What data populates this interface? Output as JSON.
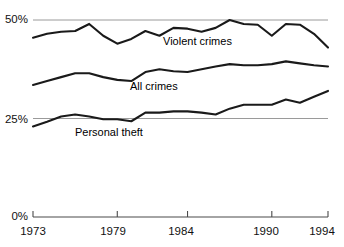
{
  "chart_data": {
    "type": "line",
    "title": "",
    "subtitle": "",
    "xlabel": "",
    "ylabel": "",
    "xlim": [
      1973,
      1994
    ],
    "ylim": [
      0,
      50
    ],
    "grid": true,
    "gridlines_y": [
      25,
      50
    ],
    "legend_position": "inline-annotations",
    "x": [
      1973,
      1974,
      1975,
      1976,
      1977,
      1978,
      1979,
      1980,
      1981,
      1982,
      1983,
      1984,
      1985,
      1986,
      1987,
      1988,
      1989,
      1990,
      1991,
      1992,
      1993,
      1994
    ],
    "y_ticks": [
      0,
      25,
      50
    ],
    "y_tick_labels": [
      "0%",
      "25%",
      "50%"
    ],
    "x_ticks": [
      1973,
      1979,
      1984,
      1990,
      1994
    ],
    "x_tick_labels": [
      "1973",
      "1979",
      "1984",
      "1990",
      "1994"
    ],
    "series": [
      {
        "name": "Violent crimes",
        "label": "Violent crimes",
        "color": "#1a1a1a",
        "values": [
          45.5,
          46.5,
          47.0,
          47.2,
          49.0,
          46.0,
          44.0,
          45.2,
          47.2,
          46.0,
          48.0,
          47.8,
          47.0,
          48.0,
          50.0,
          49.0,
          48.8,
          46.0,
          49.0,
          48.8,
          46.5,
          43.0
        ]
      },
      {
        "name": "All crimes",
        "label": "All crimes",
        "color": "#1a1a1a",
        "values": [
          33.5,
          34.5,
          35.5,
          36.5,
          36.5,
          35.5,
          34.8,
          34.5,
          36.8,
          37.5,
          37.0,
          36.8,
          37.5,
          38.2,
          38.8,
          38.5,
          38.5,
          38.8,
          39.5,
          39.0,
          38.5,
          38.2
        ]
      },
      {
        "name": "Personal theft",
        "label": "Personal theft",
        "color": "#1a1a1a",
        "values": [
          23.0,
          24.2,
          25.5,
          26.0,
          25.5,
          24.8,
          24.8,
          24.3,
          26.5,
          26.5,
          26.8,
          26.8,
          26.5,
          26.0,
          27.5,
          28.5,
          28.5,
          28.5,
          29.8,
          29.0,
          30.5,
          32.0
        ]
      }
    ],
    "annotations": [
      {
        "text": "Violent crimes",
        "x_px": 163,
        "y_px": 36
      },
      {
        "text": "All crimes",
        "x_px": 130,
        "y_px": 81
      },
      {
        "text": "Personal theft",
        "x_px": 75,
        "y_px": 127
      }
    ]
  },
  "axis": {
    "y_labels": [
      {
        "text": "50%"
      },
      {
        "text": "25%"
      },
      {
        "text": "0%"
      }
    ],
    "x_labels": [
      {
        "text": "1973"
      },
      {
        "text": "1979"
      },
      {
        "text": "1984"
      },
      {
        "text": "1990"
      },
      {
        "text": "1994"
      }
    ]
  },
  "colors": {
    "line": "#1a1a1a",
    "gridline": "#9a9a9a",
    "axis": "#4a4a4a",
    "background": "#ffffff",
    "text": "#111111"
  }
}
